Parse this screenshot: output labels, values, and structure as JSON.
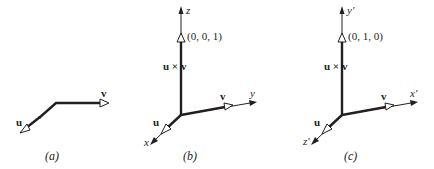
{
  "figure": {
    "panels": [
      {
        "id": "a",
        "caption": "(a)",
        "vectors": [
          {
            "name": "u",
            "label": "u",
            "style": "bold"
          },
          {
            "name": "v",
            "label": "v",
            "style": "bold"
          }
        ]
      },
      {
        "id": "b",
        "caption": "(b)",
        "vectors": [
          {
            "name": "u",
            "label": "u",
            "style": "bold"
          },
          {
            "name": "v",
            "label": "v",
            "style": "bold"
          },
          {
            "name": "u-cross-v",
            "label": "u × v",
            "style": "bold"
          }
        ],
        "axes": [
          {
            "name": "x",
            "label": "x"
          },
          {
            "name": "y",
            "label": "y"
          },
          {
            "name": "z",
            "label": "z"
          }
        ],
        "point_label": "(0, 0, 1)"
      },
      {
        "id": "c",
        "caption": "(c)",
        "vectors": [
          {
            "name": "u",
            "label": "u",
            "style": "bold"
          },
          {
            "name": "v",
            "label": "v",
            "style": "bold"
          },
          {
            "name": "u-cross-v",
            "label": "u × v",
            "style": "bold"
          }
        ],
        "axes": [
          {
            "name": "x-prime",
            "label": "x′"
          },
          {
            "name": "y-prime",
            "label": "y′"
          },
          {
            "name": "z-prime",
            "label": "z′"
          }
        ],
        "point_label": "(0, 1, 0)"
      }
    ]
  }
}
